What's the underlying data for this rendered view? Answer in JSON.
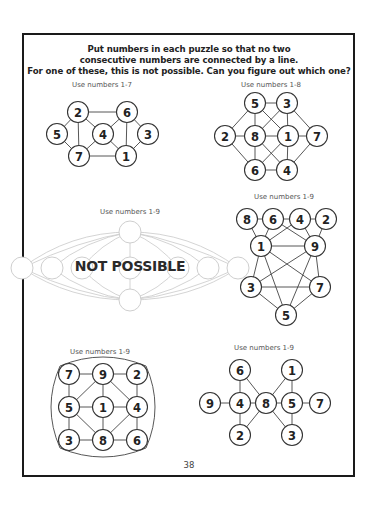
{
  "instructions": {
    "line1": "Put numbers in each puzzle so that no two",
    "line2": "consecutive  numbers are connected  by a line.",
    "line3": "For one of these, this is not possible.  Can you figure out which one?"
  },
  "puzzles": [
    {
      "label": "Use numbers 1-7",
      "nodes": [
        {
          "id": "a",
          "value": "2",
          "x": 78,
          "y": 112
        },
        {
          "id": "b",
          "value": "6",
          "x": 127,
          "y": 112
        },
        {
          "id": "c",
          "value": "5",
          "x": 57,
          "y": 134
        },
        {
          "id": "d",
          "value": "4",
          "x": 103,
          "y": 134
        },
        {
          "id": "e",
          "value": "3",
          "x": 148,
          "y": 134
        },
        {
          "id": "f",
          "value": "7",
          "x": 79,
          "y": 156
        },
        {
          "id": "g",
          "value": "1",
          "x": 126,
          "y": 156
        }
      ],
      "edges": [
        [
          "a",
          "b"
        ],
        [
          "a",
          "c"
        ],
        [
          "a",
          "f"
        ],
        [
          "a",
          "d"
        ],
        [
          "b",
          "d"
        ],
        [
          "b",
          "g"
        ],
        [
          "b",
          "e"
        ],
        [
          "c",
          "f"
        ],
        [
          "d",
          "f"
        ],
        [
          "d",
          "g"
        ],
        [
          "e",
          "g"
        ],
        [
          "f",
          "g"
        ]
      ]
    },
    {
      "label": "Use numbers 1-8",
      "nodes": [
        {
          "id": "a",
          "value": "5",
          "x": 255,
          "y": 103
        },
        {
          "id": "b",
          "value": "3",
          "x": 287,
          "y": 103
        },
        {
          "id": "c",
          "value": "2",
          "x": 225,
          "y": 136
        },
        {
          "id": "d",
          "value": "8",
          "x": 255,
          "y": 136
        },
        {
          "id": "e",
          "value": "1",
          "x": 288,
          "y": 136
        },
        {
          "id": "f",
          "value": "7",
          "x": 317,
          "y": 136
        },
        {
          "id": "g",
          "value": "6",
          "x": 255,
          "y": 170
        },
        {
          "id": "h",
          "value": "4",
          "x": 287,
          "y": 170
        }
      ],
      "edges": [
        [
          "a",
          "b"
        ],
        [
          "a",
          "c"
        ],
        [
          "a",
          "d"
        ],
        [
          "a",
          "e"
        ],
        [
          "b",
          "d"
        ],
        [
          "b",
          "e"
        ],
        [
          "b",
          "f"
        ],
        [
          "c",
          "d"
        ],
        [
          "d",
          "e"
        ],
        [
          "e",
          "f"
        ],
        [
          "c",
          "g"
        ],
        [
          "d",
          "g"
        ],
        [
          "d",
          "h"
        ],
        [
          "e",
          "g"
        ],
        [
          "e",
          "h"
        ],
        [
          "f",
          "h"
        ],
        [
          "g",
          "h"
        ]
      ]
    },
    {
      "label": "Use numbers 1-9",
      "overlay": "NOT POSSIBLE"
    },
    {
      "label": "Use numbers 1-9",
      "nodes": [
        {
          "id": "a",
          "value": "8",
          "x": 247,
          "y": 219
        },
        {
          "id": "b",
          "value": "6",
          "x": 273,
          "y": 219
        },
        {
          "id": "c",
          "value": "4",
          "x": 300,
          "y": 219
        },
        {
          "id": "d",
          "value": "2",
          "x": 326,
          "y": 219
        },
        {
          "id": "e",
          "value": "1",
          "x": 261,
          "y": 246
        },
        {
          "id": "f",
          "value": "9",
          "x": 315,
          "y": 246
        },
        {
          "id": "g",
          "value": "3",
          "x": 251,
          "y": 287
        },
        {
          "id": "h",
          "value": "7",
          "x": 320,
          "y": 287
        },
        {
          "id": "i",
          "value": "5",
          "x": 286,
          "y": 315
        }
      ],
      "edges": [
        [
          "a",
          "b"
        ],
        [
          "b",
          "c"
        ],
        [
          "c",
          "d"
        ],
        [
          "a",
          "e"
        ],
        [
          "b",
          "e"
        ],
        [
          "c",
          "e"
        ],
        [
          "b",
          "f"
        ],
        [
          "c",
          "f"
        ],
        [
          "d",
          "f"
        ],
        [
          "e",
          "f"
        ],
        [
          "e",
          "g"
        ],
        [
          "e",
          "h"
        ],
        [
          "e",
          "i"
        ],
        [
          "f",
          "g"
        ],
        [
          "f",
          "h"
        ],
        [
          "f",
          "i"
        ],
        [
          "g",
          "h"
        ],
        [
          "g",
          "i"
        ],
        [
          "h",
          "i"
        ]
      ]
    },
    {
      "label": "Use numbers 1-9",
      "nodes": [
        {
          "id": "a",
          "value": "7",
          "x": 69,
          "y": 374
        },
        {
          "id": "b",
          "value": "9",
          "x": 103,
          "y": 374
        },
        {
          "id": "c",
          "value": "2",
          "x": 137,
          "y": 374
        },
        {
          "id": "d",
          "value": "5",
          "x": 69,
          "y": 407
        },
        {
          "id": "e",
          "value": "1",
          "x": 103,
          "y": 407
        },
        {
          "id": "f",
          "value": "4",
          "x": 137,
          "y": 407
        },
        {
          "id": "g",
          "value": "3",
          "x": 69,
          "y": 440
        },
        {
          "id": "h",
          "value": "8",
          "x": 103,
          "y": 440
        },
        {
          "id": "i",
          "value": "6",
          "x": 137,
          "y": 440
        }
      ],
      "edges": [
        [
          "a",
          "b"
        ],
        [
          "b",
          "c"
        ],
        [
          "a",
          "d"
        ],
        [
          "c",
          "f"
        ],
        [
          "d",
          "g"
        ],
        [
          "f",
          "i"
        ],
        [
          "g",
          "h"
        ],
        [
          "h",
          "i"
        ],
        [
          "d",
          "e"
        ],
        [
          "e",
          "f"
        ],
        [
          "b",
          "e"
        ],
        [
          "e",
          "h"
        ],
        [
          "b",
          "d"
        ],
        [
          "b",
          "f"
        ],
        [
          "d",
          "h"
        ],
        [
          "f",
          "h"
        ]
      ]
    },
    {
      "label": "Use numbers 1-9",
      "nodes": [
        {
          "id": "a",
          "value": "6",
          "x": 240,
          "y": 370
        },
        {
          "id": "b",
          "value": "1",
          "x": 292,
          "y": 370
        },
        {
          "id": "c",
          "value": "9",
          "x": 210,
          "y": 403
        },
        {
          "id": "d",
          "value": "4",
          "x": 240,
          "y": 403
        },
        {
          "id": "e",
          "value": "8",
          "x": 266,
          "y": 403
        },
        {
          "id": "f",
          "value": "5",
          "x": 292,
          "y": 403
        },
        {
          "id": "g",
          "value": "7",
          "x": 320,
          "y": 403
        },
        {
          "id": "h",
          "value": "2",
          "x": 240,
          "y": 435
        },
        {
          "id": "i",
          "value": "3",
          "x": 292,
          "y": 435
        }
      ],
      "edges": [
        [
          "a",
          "d"
        ],
        [
          "a",
          "e"
        ],
        [
          "c",
          "d"
        ],
        [
          "d",
          "e"
        ],
        [
          "d",
          "h"
        ],
        [
          "e",
          "h"
        ],
        [
          "e",
          "f"
        ],
        [
          "e",
          "b"
        ],
        [
          "e",
          "i"
        ],
        [
          "b",
          "f"
        ],
        [
          "f",
          "g"
        ],
        [
          "f",
          "i"
        ]
      ]
    }
  ],
  "page_number": "38"
}
